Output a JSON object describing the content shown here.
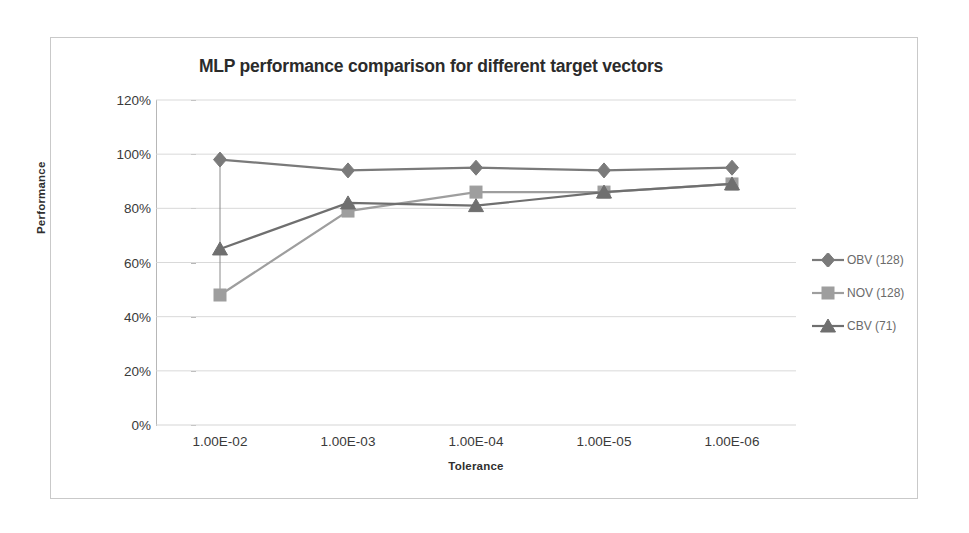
{
  "chart_data": {
    "type": "line",
    "title": "MLP performance comparison for different target vectors",
    "xlabel": "Tolerance",
    "ylabel": "Performance",
    "categories": [
      "1.00E-02",
      "1.00E-03",
      "1.00E-04",
      "1.00E-05",
      "1.00E-06"
    ],
    "ylim": [
      0,
      120
    ],
    "ytick_labels": [
      "0%",
      "20%",
      "40%",
      "60%",
      "80%",
      "100%",
      "120%"
    ],
    "ytick_values": [
      0,
      20,
      40,
      60,
      80,
      100,
      120
    ],
    "grid": "horizontal",
    "legend_position": "right",
    "series": [
      {
        "name": "OBV (128)",
        "marker": "diamond",
        "color": "#7a7a7a",
        "values": [
          98,
          94,
          95,
          94,
          95
        ]
      },
      {
        "name": "NOV (128)",
        "marker": "square",
        "color": "#9e9e9e",
        "values": [
          48,
          79,
          86,
          86,
          89
        ]
      },
      {
        "name": "CBV (71)",
        "marker": "triangle",
        "color": "#6f6f6f",
        "values": [
          65,
          82,
          81,
          86,
          89
        ]
      }
    ]
  }
}
